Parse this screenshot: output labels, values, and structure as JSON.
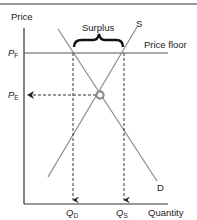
{
  "diagram": {
    "type": "supply-demand price floor",
    "axes": {
      "y_label": "Price",
      "x_label": "Quantity"
    },
    "price_labels": {
      "floor": {
        "main": "P",
        "sub": "F"
      },
      "equilibrium": {
        "main": "P",
        "sub": "E"
      }
    },
    "quantity_labels": {
      "demanded": {
        "main": "Q",
        "sub": "D"
      },
      "supplied": {
        "main": "Q",
        "sub": "S"
      }
    },
    "curves": {
      "supply": "S",
      "demand": "D"
    },
    "price_floor_label": "Price floor",
    "surplus_label": "Surplus",
    "colors": {
      "axis": "#333333",
      "curve": "#8a8a8a",
      "floor_line": "#555555",
      "dashed": "#333333",
      "equilibrium_marker": "#8a8a8a",
      "top_rule": "#9a9a9a"
    }
  }
}
